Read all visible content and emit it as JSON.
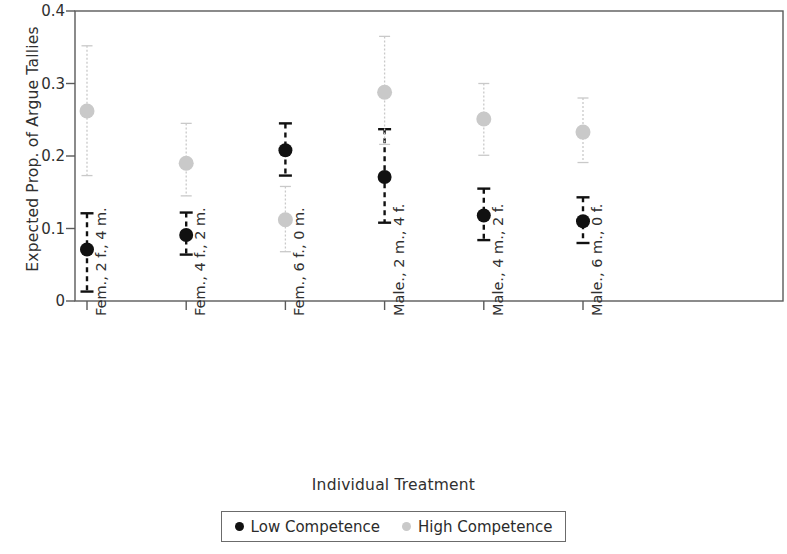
{
  "chart_data": {
    "type": "scatter",
    "title": "",
    "xlabel": "Individual Treatment",
    "ylabel": "Expected Prop. of Argue Tallies",
    "ylim": [
      0,
      0.4
    ],
    "yticks": [
      0,
      0.1,
      0.2,
      0.3,
      0.4
    ],
    "ytick_labels": [
      "0",
      "0.1",
      "0.2",
      "0.3",
      "0.4"
    ],
    "grid": false,
    "legend_position": "bottom",
    "categories": [
      "Fem., 2 f., 4 m.",
      "Fem., 4 f., 2 m.",
      "Fem., 6 f., 0 m.",
      "Male., 2 m., 4 f.",
      "Male., 4 m., 2 f.",
      "Male., 6 m., 0 f."
    ],
    "series": [
      {
        "name": "Low Competence",
        "color": "#111111",
        "values": [
          0.071,
          0.091,
          0.208,
          0.171,
          0.118,
          0.11
        ],
        "ci_low": [
          0.013,
          0.064,
          0.173,
          0.108,
          0.084,
          0.08
        ],
        "ci_high": [
          0.121,
          0.122,
          0.245,
          0.237,
          0.155,
          0.143
        ]
      },
      {
        "name": "High Competence",
        "color": "#c9c9c9",
        "values": [
          0.262,
          0.19,
          0.112,
          0.288,
          0.251,
          0.233
        ],
        "ci_low": [
          0.173,
          0.145,
          0.068,
          0.216,
          0.201,
          0.191
        ],
        "ci_high": [
          0.352,
          0.245,
          0.158,
          0.365,
          0.3,
          0.28
        ]
      }
    ]
  },
  "legend": {
    "entries": [
      {
        "label": "Low Competence",
        "marker": "filled-circle-black"
      },
      {
        "label": "High Competence",
        "marker": "filled-circle-gray"
      }
    ]
  }
}
